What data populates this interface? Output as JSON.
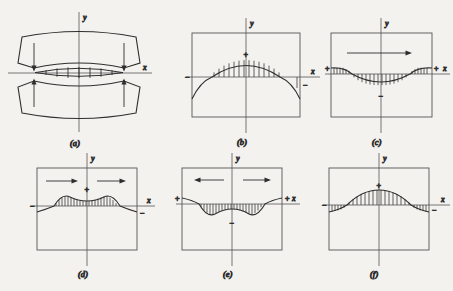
{
  "figure": {
    "background_color": "#f4f2ee",
    "line_color": "#2e2e2e",
    "text_color": "#3a3a3a",
    "panel_count": 6
  },
  "axis_labels": {
    "x": "x",
    "y": "y"
  },
  "signs": {
    "positive": "+",
    "negative": "−"
  },
  "panels": [
    {
      "id": "a",
      "caption": "(a)",
      "type": "contact-bodies",
      "description": "Two curved bodies pressed together with a lens-shaped contact patch subdivided by vertical ticks; arrows point inward from above and below at both ends of the contact.",
      "has_frame": false,
      "arrows": [
        {
          "direction": "down",
          "position": "left"
        },
        {
          "direction": "down",
          "position": "right"
        },
        {
          "direction": "up",
          "position": "left"
        },
        {
          "direction": "up",
          "position": "right"
        }
      ],
      "sign_markers": []
    },
    {
      "id": "b",
      "caption": "(b)",
      "type": "stress-distribution",
      "description": "Single broad positive arch hatched above the x-axis, curve dipping below the axis at both edges.",
      "has_frame": true,
      "lobes": 1,
      "polarity": "positive",
      "arrows": [],
      "sign_markers": [
        {
          "label": "+",
          "position": "center-top"
        },
        {
          "label": "−",
          "position": "left-edge"
        },
        {
          "label": "−",
          "position": "right-edge"
        }
      ]
    },
    {
      "id": "c",
      "caption": "(c)",
      "type": "stress-distribution",
      "description": "Single broad negative trough hatched below the x-axis, rising above the axis at both edges; one arrow pointing right above the curve.",
      "has_frame": true,
      "lobes": 1,
      "polarity": "negative",
      "arrows": [
        {
          "direction": "right",
          "position": "center"
        }
      ],
      "sign_markers": [
        {
          "label": "+",
          "position": "left-edge"
        },
        {
          "label": "+",
          "position": "right-edge"
        },
        {
          "label": "−",
          "position": "center-bottom"
        }
      ]
    },
    {
      "id": "d",
      "caption": "(d)",
      "type": "stress-distribution",
      "description": "Double-humped positive curve with a shallow dip at center, hatched above the x-axis; two arrows pointing right.",
      "has_frame": true,
      "lobes": 2,
      "polarity": "positive",
      "arrows": [
        {
          "direction": "right",
          "position": "left"
        },
        {
          "direction": "right",
          "position": "center-right"
        }
      ],
      "sign_markers": [
        {
          "label": "+",
          "position": "center-top"
        },
        {
          "label": "−",
          "position": "left-edge"
        },
        {
          "label": "−",
          "position": "right-edge"
        }
      ]
    },
    {
      "id": "e",
      "caption": "(e)",
      "type": "stress-distribution",
      "description": "Double-trough negative curve with a small rise at center, hatched below the x-axis; two arrows diverging left and right.",
      "has_frame": true,
      "lobes": 2,
      "polarity": "negative",
      "arrows": [
        {
          "direction": "left",
          "position": "left"
        },
        {
          "direction": "right",
          "position": "right"
        }
      ],
      "sign_markers": [
        {
          "label": "+",
          "position": "left-edge"
        },
        {
          "label": "+",
          "position": "right-edge"
        },
        {
          "label": "−",
          "position": "center-bottom"
        }
      ]
    },
    {
      "id": "f",
      "caption": "(f)",
      "type": "stress-distribution",
      "description": "Single flat-topped positive arch hatched above the x-axis, dipping below at both edges; no arrows.",
      "has_frame": true,
      "lobes": 1,
      "polarity": "positive",
      "arrows": [],
      "sign_markers": [
        {
          "label": "+",
          "position": "center-top"
        },
        {
          "label": "−",
          "position": "left-edge"
        },
        {
          "label": "−",
          "position": "right-edge"
        }
      ]
    }
  ]
}
